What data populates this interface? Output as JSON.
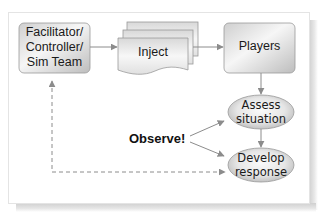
{
  "diagram": {
    "nodes": {
      "facilitator": {
        "lines": [
          "Facilitator/",
          "Controller/",
          "Sim Team"
        ],
        "shape": "rounded-rectangle"
      },
      "inject": {
        "label": "Inject",
        "shape": "stacked-documents"
      },
      "players": {
        "label": "Players",
        "shape": "rounded-rectangle"
      },
      "assess": {
        "lines": [
          "Assess",
          "situation"
        ],
        "shape": "ellipse"
      },
      "develop": {
        "lines": [
          "Develop",
          "response"
        ],
        "shape": "ellipse"
      }
    },
    "annotation": {
      "label": "Observe!"
    },
    "edges": [
      {
        "from": "facilitator",
        "to": "inject",
        "style": "solid"
      },
      {
        "from": "inject",
        "to": "players",
        "style": "solid"
      },
      {
        "from": "players",
        "to": "assess",
        "style": "solid"
      },
      {
        "from": "assess",
        "to": "develop",
        "style": "solid"
      },
      {
        "from": "observe",
        "to": "assess",
        "style": "solid"
      },
      {
        "from": "observe",
        "to": "develop",
        "style": "solid"
      },
      {
        "from": "facilitator",
        "to": "develop",
        "style": "dashed",
        "bidirectional": true
      }
    ],
    "colors": {
      "node_fill_light": "#f4f4f4",
      "node_fill_dark": "#c4c4c4",
      "node_stroke": "#8a8a8a",
      "arrow": "#8c8c8c",
      "text": "#1a1a1a"
    }
  }
}
